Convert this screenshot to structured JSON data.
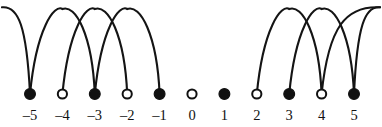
{
  "figure": {
    "title": "",
    "width": 382,
    "height": 127,
    "background_color": "#ffffff",
    "stroke_color": "#141414",
    "label_color": "#111111"
  },
  "chart_data": {
    "type": "diagram",
    "subtype": "number-line-arc-diagram",
    "title": "",
    "xlabel": "",
    "ylabel": "",
    "axis": {
      "orientation": "horizontal",
      "visible_line": false,
      "min": -5,
      "max": 5,
      "step": 1
    },
    "geometry": {
      "first_node_x": 30,
      "node_spacing_x": 32.4,
      "node_center_y": 94,
      "filled_radius": 5.4,
      "open_radius": 4.6,
      "label_baseline_y": 120,
      "arc_apex_y": 9,
      "arc_span_units": 2,
      "left_edge_x": 2,
      "right_edge_x": 380
    },
    "tick_labels": [
      "–5",
      "–4",
      "–3",
      "–2",
      "–1",
      "0",
      "1",
      "2",
      "3",
      "4",
      "5"
    ],
    "nodes": [
      {
        "value": -5,
        "label": "–5",
        "fill": "filled",
        "has_arcs": true
      },
      {
        "value": -4,
        "label": "–4",
        "fill": "open",
        "has_arcs": true
      },
      {
        "value": -3,
        "label": "–3",
        "fill": "filled",
        "has_arcs": true
      },
      {
        "value": -2,
        "label": "–2",
        "fill": "open",
        "has_arcs": true
      },
      {
        "value": -1,
        "label": "–1",
        "fill": "filled",
        "has_arcs": true
      },
      {
        "value": 0,
        "label": "0",
        "fill": "open",
        "has_arcs": false
      },
      {
        "value": 1,
        "label": "1",
        "fill": "filled",
        "has_arcs": false
      },
      {
        "value": 2,
        "label": "2",
        "fill": "open",
        "has_arcs": true
      },
      {
        "value": 3,
        "label": "3",
        "fill": "filled",
        "has_arcs": true
      },
      {
        "value": 4,
        "label": "4",
        "fill": "open",
        "has_arcs": true
      },
      {
        "value": 5,
        "label": "5",
        "fill": "filled",
        "has_arcs": true
      }
    ],
    "arcs": [
      {
        "from": -5,
        "to": -3,
        "side": "left",
        "open_ended": false
      },
      {
        "from": -4,
        "to": -2,
        "side": "left",
        "open_ended": false
      },
      {
        "from": -3,
        "to": -1,
        "side": "left",
        "open_ended": false
      },
      {
        "from": -5,
        "to": null,
        "side": "left",
        "open_ended": true,
        "direction": "left-edge"
      },
      {
        "from": 2,
        "to": 4,
        "side": "right",
        "open_ended": false
      },
      {
        "from": 3,
        "to": 5,
        "side": "right",
        "open_ended": false
      },
      {
        "from": 4,
        "to": null,
        "side": "right",
        "open_ended": true,
        "direction": "right-edge"
      },
      {
        "from": 5,
        "to": null,
        "side": "right",
        "open_ended": true,
        "direction": "right-edge"
      }
    ],
    "legend": [],
    "annotations": []
  }
}
